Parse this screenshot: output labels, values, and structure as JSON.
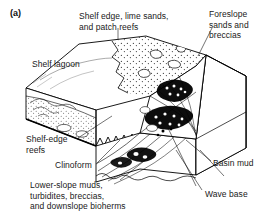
{
  "figure": {
    "panel_letter": "(a)",
    "background_color": "#ffffff",
    "line_color": "#000000",
    "stipple_color": "#555555"
  },
  "labels": {
    "shelf_edge_lime_sands": "Shelf edge, lime sands,\nand patch reefs",
    "foreslope_sands": "Foreslope\nsands and\nbreccias",
    "shelf_lagoon": "Shelf lagoon",
    "shelf_edge_reefs": "Shelf-edge\nreefs",
    "clinoform": "Clinoform",
    "lower_slope_muds": "Lower-slope muds,\nturbidites, breccias,\nand downslope bioherms",
    "basin_mud": "Basin mud",
    "wave_base": "Wave base"
  }
}
